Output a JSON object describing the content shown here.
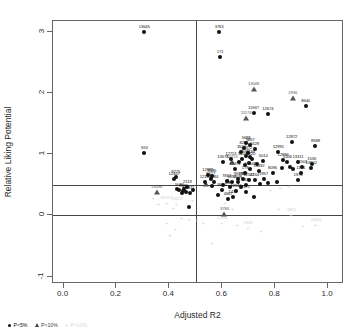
{
  "chart_data": {
    "type": "scatter",
    "title": "",
    "xlabel": "Adjusted R2",
    "ylabel": "Relative Liking Potential",
    "xlim": [
      -0.04,
      1.06
    ],
    "ylim": [
      -1.12,
      3.18
    ],
    "xticks": [
      "0.0",
      "0.2",
      "0.4",
      "0.6",
      "0.8",
      "1.0"
    ],
    "xtickvals": [
      0.0,
      0.2,
      0.4,
      0.6,
      0.8,
      1.0
    ],
    "yticks": [
      "3",
      "2",
      "1",
      "0",
      "-1"
    ],
    "ytickvals": [
      3,
      2,
      1,
      0,
      -1
    ],
    "grid": false,
    "reference_lines": {
      "vertical_x": 0.5,
      "horizontal_y": [
        0.5,
        0.0
      ]
    },
    "legend": {
      "position": "bottom-left",
      "entries": [
        {
          "label": "P<5%",
          "marker": "circle",
          "color": "#111111"
        },
        {
          "label": "P<10%",
          "marker": "triangle",
          "color": "#3f3f3f"
        },
        {
          "label": "P>10%",
          "marker": "plus",
          "color": "#d8d8d8"
        }
      ]
    },
    "series": [
      {
        "name": "P<5%",
        "marker": "circle",
        "color": "#111111",
        "points": [
          {
            "x": 0.305,
            "y": 3.0,
            "label": "13645"
          },
          {
            "x": 0.588,
            "y": 3.0,
            "label": "3763"
          },
          {
            "x": 0.592,
            "y": 2.59,
            "label": "171"
          },
          {
            "x": 0.915,
            "y": 1.79,
            "label": "8640"
          },
          {
            "x": 0.718,
            "y": 1.68,
            "label": "11947"
          },
          {
            "x": 0.772,
            "y": 1.66,
            "label": "12674"
          },
          {
            "x": 0.862,
            "y": 1.2,
            "label": "12872"
          },
          {
            "x": 0.952,
            "y": 1.13,
            "label": "8588"
          },
          {
            "x": 0.305,
            "y": 1.02,
            "label": "553"
          },
          {
            "x": 0.69,
            "y": 1.18,
            "label": "5688"
          },
          {
            "x": 0.706,
            "y": 1.15,
            "label": "9867"
          },
          {
            "x": 0.682,
            "y": 1.1,
            "label": "8284"
          },
          {
            "x": 0.722,
            "y": 1.09,
            "label": "9428"
          },
          {
            "x": 0.672,
            "y": 1.04,
            "label": "3524"
          },
          {
            "x": 0.696,
            "y": 1.03,
            "label": "2372"
          },
          {
            "x": 0.812,
            "y": 1.04,
            "label": "12991"
          },
          {
            "x": 0.688,
            "y": 0.97,
            "label": "1022"
          },
          {
            "x": 0.706,
            "y": 0.96,
            "label": "2639"
          },
          {
            "x": 0.676,
            "y": 0.92,
            "label": "5426"
          },
          {
            "x": 0.712,
            "y": 0.92,
            "label": "820"
          },
          {
            "x": 0.755,
            "y": 0.89,
            "label": "5014"
          },
          {
            "x": 0.83,
            "y": 0.9,
            "label": "12886"
          },
          {
            "x": 0.846,
            "y": 0.88,
            "label": "5106"
          },
          {
            "x": 0.886,
            "y": 0.87,
            "label": "13311"
          },
          {
            "x": 0.938,
            "y": 0.85,
            "label": "1536"
          },
          {
            "x": 0.902,
            "y": 0.79,
            "label": "11501"
          },
          {
            "x": 0.936,
            "y": 0.78,
            "label": "13802"
          },
          {
            "x": 0.602,
            "y": 0.87,
            "label": "13678"
          },
          {
            "x": 0.632,
            "y": 0.92,
            "label": "12713"
          },
          {
            "x": 0.648,
            "y": 0.76,
            "label": "12471"
          },
          {
            "x": 0.706,
            "y": 0.76,
            "label": "13648"
          },
          {
            "x": 0.738,
            "y": 0.72,
            "label": "13492"
          },
          {
            "x": 0.686,
            "y": 0.7,
            "label": "178"
          },
          {
            "x": 0.79,
            "y": 0.69,
            "label": "8096"
          },
          {
            "x": 0.896,
            "y": 0.69,
            "label": "1174"
          },
          {
            "x": 0.545,
            "y": 0.66,
            "label": "12988"
          },
          {
            "x": 0.56,
            "y": 0.64,
            "label": "5046"
          },
          {
            "x": 0.424,
            "y": 0.63,
            "label": "9775"
          },
          {
            "x": 0.418,
            "y": 0.59,
            "label": "12467"
          },
          {
            "x": 0.556,
            "y": 0.6,
            "label": "9417"
          },
          {
            "x": 0.66,
            "y": 0.6,
            "label": "9558"
          },
          {
            "x": 0.678,
            "y": 0.59,
            "label": "7367"
          },
          {
            "x": 0.7,
            "y": 0.58,
            "label": "12547"
          },
          {
            "x": 0.722,
            "y": 0.58,
            "label": "2244"
          },
          {
            "x": 0.756,
            "y": 0.6,
            "label": "1957"
          },
          {
            "x": 0.886,
            "y": 0.58,
            "label": "1974"
          },
          {
            "x": 0.536,
            "y": 0.55,
            "label": "12104"
          },
          {
            "x": 0.568,
            "y": 0.55,
            "label": "4984"
          },
          {
            "x": 0.616,
            "y": 0.56,
            "label": "7817"
          },
          {
            "x": 0.636,
            "y": 0.55,
            "label": "9852"
          },
          {
            "x": 0.658,
            "y": 0.54,
            "label": "9538"
          },
          {
            "x": 0.69,
            "y": 0.5,
            "label": "4436"
          },
          {
            "x": 0.468,
            "y": 0.47,
            "label": "2119"
          },
          {
            "x": 0.438,
            "y": 0.42,
            "label": "5080"
          },
          {
            "x": 0.452,
            "y": 0.4,
            "label": "9939"
          },
          {
            "x": 0.462,
            "y": 0.38,
            "label": "3111"
          },
          {
            "x": 0.478,
            "y": 0.36,
            "label": "9611"
          },
          {
            "x": 0.598,
            "y": 0.42,
            "label": "9620"
          },
          {
            "x": 0.652,
            "y": 0.4,
            "label": "12615"
          },
          {
            "x": 0.688,
            "y": 0.38,
            "label": "9371"
          },
          {
            "x": 0.64,
            "y": 0.3,
            "label": "1431"
          },
          {
            "x": 0.622,
            "y": 0.27,
            "label": "4667"
          },
          {
            "x": 0.474,
            "y": 0.14,
            "label": ""
          },
          {
            "x": 0.585,
            "y": 0.34,
            "label": ""
          },
          {
            "x": 0.43,
            "y": 0.44,
            "label": ""
          },
          {
            "x": 0.446,
            "y": 0.36,
            "label": ""
          },
          {
            "x": 0.456,
            "y": 0.44,
            "label": ""
          },
          {
            "x": 0.488,
            "y": 0.42,
            "label": ""
          },
          {
            "x": 0.56,
            "y": 0.48,
            "label": ""
          },
          {
            "x": 0.604,
            "y": 0.5,
            "label": ""
          },
          {
            "x": 0.628,
            "y": 0.47,
            "label": ""
          },
          {
            "x": 0.672,
            "y": 0.46,
            "label": ""
          },
          {
            "x": 0.744,
            "y": 0.52,
            "label": ""
          },
          {
            "x": 0.774,
            "y": 0.53,
            "label": ""
          },
          {
            "x": 0.806,
            "y": 0.55,
            "label": ""
          },
          {
            "x": 0.826,
            "y": 0.78,
            "label": ""
          },
          {
            "x": 0.856,
            "y": 0.8,
            "label": ""
          },
          {
            "x": 0.868,
            "y": 0.76,
            "label": ""
          },
          {
            "x": 0.7,
            "y": 0.86,
            "label": ""
          },
          {
            "x": 0.73,
            "y": 0.84,
            "label": ""
          },
          {
            "x": 0.684,
            "y": 0.83,
            "label": ""
          },
          {
            "x": 0.664,
            "y": 0.87,
            "label": ""
          },
          {
            "x": 0.718,
            "y": 0.3,
            "label": ""
          }
        ]
      },
      {
        "name": "P<10%",
        "marker": "triangle",
        "color": "#555555",
        "points": [
          {
            "x": 0.718,
            "y": 2.07,
            "label": "13048"
          },
          {
            "x": 0.866,
            "y": 1.92,
            "label": "2936"
          },
          {
            "x": 0.69,
            "y": 1.6,
            "label": "11174"
          },
          {
            "x": 0.636,
            "y": 0.88,
            "label": "12713"
          },
          {
            "x": 0.352,
            "y": 0.39,
            "label": "13096"
          },
          {
            "x": 0.608,
            "y": 0.03,
            "label": "3784"
          },
          {
            "x": 0.538,
            "y": 0.52,
            "label": ""
          },
          {
            "x": 0.622,
            "y": 0.56,
            "label": ""
          }
        ]
      },
      {
        "name": "P>10%",
        "marker": "plus",
        "color": "#d2d2d2",
        "points": [
          {
            "x": 0.372,
            "y": 0.3,
            "label": ""
          },
          {
            "x": 0.392,
            "y": 0.21,
            "label": "11217"
          },
          {
            "x": 0.428,
            "y": 0.18,
            "label": "13621"
          },
          {
            "x": 0.36,
            "y": 0.18,
            "label": ""
          },
          {
            "x": 0.416,
            "y": 0.12,
            "label": ""
          },
          {
            "x": 0.448,
            "y": -0.04,
            "label": ""
          },
          {
            "x": 0.478,
            "y": -0.06,
            "label": ""
          },
          {
            "x": 0.506,
            "y": -0.08,
            "label": ""
          },
          {
            "x": 0.53,
            "y": -0.12,
            "label": ""
          },
          {
            "x": 0.392,
            "y": -0.12,
            "label": ""
          },
          {
            "x": 0.424,
            "y": -0.22,
            "label": ""
          },
          {
            "x": 0.404,
            "y": -0.32,
            "label": ""
          },
          {
            "x": 0.562,
            "y": -0.45,
            "label": ""
          },
          {
            "x": 0.6,
            "y": -0.12,
            "label": "12641"
          },
          {
            "x": 0.658,
            "y": -0.16,
            "label": ""
          },
          {
            "x": 0.698,
            "y": -0.21,
            "label": "1931"
          },
          {
            "x": 0.748,
            "y": -0.25,
            "label": ""
          },
          {
            "x": 0.816,
            "y": 0.1,
            "label": ""
          },
          {
            "x": 0.862,
            "y": 0.0,
            "label": "9801"
          },
          {
            "x": 0.906,
            "y": -0.17,
            "label": ""
          },
          {
            "x": 0.954,
            "y": -0.16,
            "label": "13305"
          },
          {
            "x": 0.784,
            "y": 0.42,
            "label": ""
          },
          {
            "x": 0.82,
            "y": 0.45,
            "label": ""
          },
          {
            "x": 0.852,
            "y": 0.49,
            "label": ""
          },
          {
            "x": 0.612,
            "y": 0.2,
            "label": ""
          },
          {
            "x": 0.64,
            "y": 0.1,
            "label": ""
          },
          {
            "x": 0.488,
            "y": 0.26,
            "label": ""
          },
          {
            "x": 0.34,
            "y": 0.28,
            "label": ""
          }
        ]
      }
    ]
  }
}
